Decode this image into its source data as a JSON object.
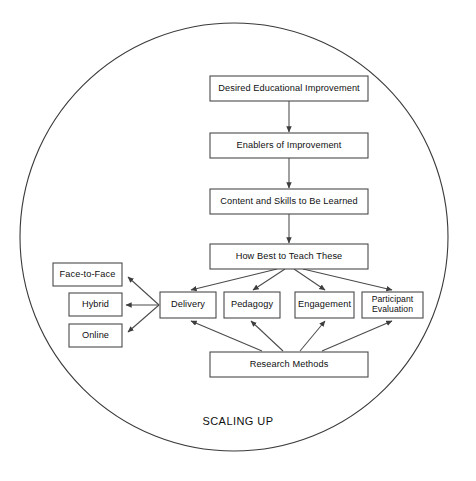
{
  "diagram": {
    "type": "flow-diagram",
    "caption": "SCALING UP",
    "boundary": {
      "shape": "circle",
      "label": "scaling-up-boundary",
      "cx": 234,
      "cy": 237,
      "r": 214
    },
    "colors": {
      "background": "#ffffff",
      "box_stroke": "#4a4a4a",
      "box_fill": "#ffffff",
      "text": "#101010",
      "connector": "#4a4a4a",
      "circle_stroke": "#3a3a3a"
    },
    "nodes": [
      {
        "id": "desired-educational-improvement",
        "label": "Desired Educational Improvement",
        "lines": [
          "Desired Educational Improvement"
        ],
        "x": 210,
        "y": 76,
        "w": 158,
        "h": 25
      },
      {
        "id": "enablers-of-improvement",
        "label": "Enablers of Improvement",
        "lines": [
          "Enablers of Improvement"
        ],
        "x": 210,
        "y": 133,
        "w": 158,
        "h": 25
      },
      {
        "id": "content-and-skills-to-be-learned",
        "label": "Content and Skills to Be Learned",
        "lines": [
          "Content and Skills to Be Learned"
        ],
        "x": 210,
        "y": 189,
        "w": 158,
        "h": 25
      },
      {
        "id": "how-best-to-teach-these",
        "label": "How Best to Teach These",
        "lines": [
          "How Best to Teach These"
        ],
        "x": 210,
        "y": 244,
        "w": 158,
        "h": 25
      },
      {
        "id": "delivery",
        "label": "Delivery",
        "lines": [
          "Delivery"
        ],
        "x": 160,
        "y": 292,
        "w": 56,
        "h": 26
      },
      {
        "id": "pedagogy",
        "label": "Pedagogy",
        "lines": [
          "Pedagogy"
        ],
        "x": 224,
        "y": 292,
        "w": 56,
        "h": 26
      },
      {
        "id": "engagement",
        "label": "Engagement",
        "lines": [
          "Engagement"
        ],
        "x": 295,
        "y": 292,
        "w": 59,
        "h": 26
      },
      {
        "id": "participant-evaluation",
        "label": "Participant Evaluation",
        "lines": [
          "Participant",
          "Evaluation"
        ],
        "x": 362,
        "y": 292,
        "w": 61,
        "h": 26
      },
      {
        "id": "research-methods",
        "label": "Research Methods",
        "lines": [
          "Research Methods"
        ],
        "x": 210,
        "y": 352,
        "w": 158,
        "h": 25
      },
      {
        "id": "face-to-face",
        "label": "Face-to-Face",
        "lines": [
          "Face-to-Face"
        ],
        "x": 53,
        "y": 263,
        "w": 69,
        "h": 23
      },
      {
        "id": "hybrid",
        "label": "Hybrid",
        "lines": [
          "Hybrid"
        ],
        "x": 69,
        "y": 293,
        "w": 53,
        "h": 23
      },
      {
        "id": "online",
        "label": "Online",
        "lines": [
          "Online"
        ],
        "x": 69,
        "y": 324,
        "w": 53,
        "h": 23
      }
    ],
    "edges": [
      {
        "id": "edge-desired-to-enablers",
        "from": "desired-educational-improvement",
        "to": "enablers-of-improvement",
        "x1": 289,
        "y1": 101,
        "x2": 289,
        "y2": 132
      },
      {
        "id": "edge-enablers-to-content",
        "from": "enablers-of-improvement",
        "to": "content-and-skills-to-be-learned",
        "x1": 289,
        "y1": 158,
        "x2": 289,
        "y2": 188
      },
      {
        "id": "edge-content-to-howbest",
        "from": "content-and-skills-to-be-learned",
        "to": "how-best-to-teach-these",
        "x1": 289,
        "y1": 214,
        "x2": 289,
        "y2": 243
      },
      {
        "id": "edge-howbest-to-delivery",
        "from": "how-best-to-teach-these",
        "to": "delivery",
        "x1": 277,
        "y1": 269,
        "x2": 191,
        "y2": 290
      },
      {
        "id": "edge-howbest-to-pedagogy",
        "from": "how-best-to-teach-these",
        "to": "pedagogy",
        "x1": 285,
        "y1": 269,
        "x2": 253,
        "y2": 290
      },
      {
        "id": "edge-howbest-to-engagement",
        "from": "how-best-to-teach-these",
        "to": "engagement",
        "x1": 294,
        "y1": 269,
        "x2": 325,
        "y2": 290
      },
      {
        "id": "edge-howbest-to-participant",
        "from": "how-best-to-teach-these",
        "to": "participant-evaluation",
        "x1": 303,
        "y1": 269,
        "x2": 392,
        "y2": 290
      },
      {
        "id": "edge-research-to-delivery",
        "from": "research-methods",
        "to": "delivery",
        "x1": 262,
        "y1": 351,
        "x2": 191,
        "y2": 321
      },
      {
        "id": "edge-research-to-pedagogy",
        "from": "research-methods",
        "to": "pedagogy",
        "x1": 283,
        "y1": 351,
        "x2": 251,
        "y2": 321
      },
      {
        "id": "edge-research-to-engagement",
        "from": "research-methods",
        "to": "engagement",
        "x1": 300,
        "y1": 351,
        "x2": 325,
        "y2": 321
      },
      {
        "id": "edge-research-to-participant",
        "from": "research-methods",
        "to": "participant-evaluation",
        "x1": 322,
        "y1": 351,
        "x2": 392,
        "y2": 321
      },
      {
        "id": "edge-delivery-to-face-to-face",
        "from": "delivery",
        "to": "face-to-face",
        "x1": 159,
        "y1": 305,
        "x2": 128,
        "y2": 277
      },
      {
        "id": "edge-delivery-to-hybrid",
        "from": "delivery",
        "to": "hybrid",
        "x1": 159,
        "y1": 305,
        "x2": 126,
        "y2": 305
      },
      {
        "id": "edge-delivery-to-online",
        "from": "delivery",
        "to": "online",
        "x1": 159,
        "y1": 305,
        "x2": 128,
        "y2": 332
      }
    ]
  }
}
